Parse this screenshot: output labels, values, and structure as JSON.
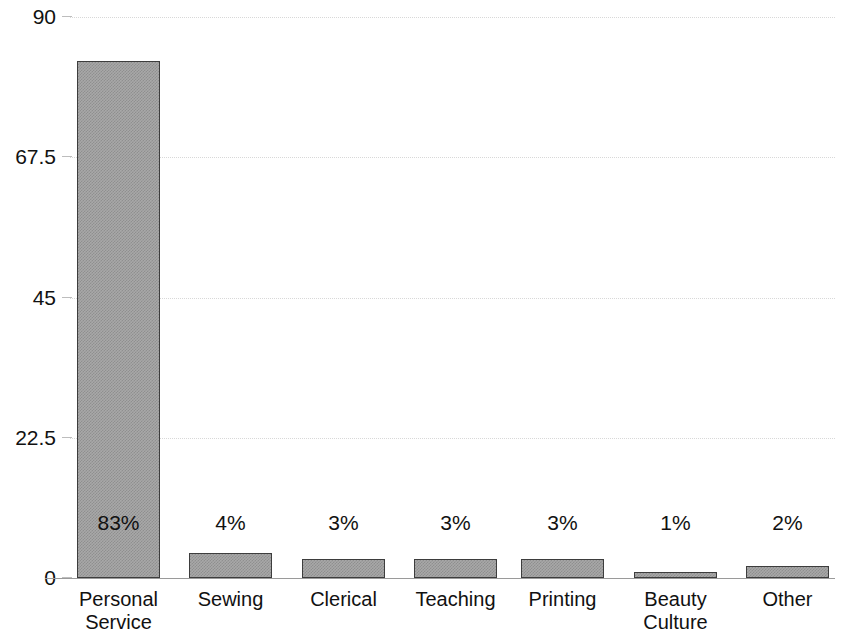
{
  "chart_data": {
    "type": "bar",
    "title": "",
    "subtitle": "",
    "xlabel": "",
    "ylabel": "",
    "categories": [
      "Personal Service",
      "Sewing",
      "Clerical",
      "Teaching",
      "Printing",
      "Beauty Culture",
      "Other"
    ],
    "category_lines": [
      [
        "Personal",
        "Service"
      ],
      [
        "Sewing"
      ],
      [
        "Clerical"
      ],
      [
        "Teaching"
      ],
      [
        "Printing"
      ],
      [
        "Beauty",
        "Culture"
      ],
      [
        "Other"
      ]
    ],
    "values": [
      83,
      4,
      3,
      3,
      3,
      1,
      2
    ],
    "data_labels": [
      "83%",
      "4%",
      "3%",
      "3%",
      "3%",
      "1%",
      "2%"
    ],
    "ylim": [
      0,
      90
    ],
    "yticks": [
      0,
      22.5,
      45,
      67.5,
      90
    ],
    "ytick_labels": [
      "0",
      "22.5",
      "45",
      "67.5",
      "90"
    ],
    "grid": true,
    "legend": "none",
    "bar_fill_color": "#a8a8a8",
    "bar_edge_color": "#3d3d3d",
    "grid_color": "#d8d8d8",
    "axis_color": "#9a9a9a",
    "text_color": "#111111",
    "background_color": "#ffffff"
  }
}
